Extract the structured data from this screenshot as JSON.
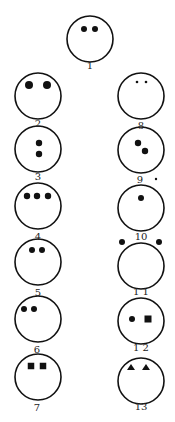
{
  "diagram": {
    "type": "figure-set",
    "stroke_color": "#111111",
    "fill_color": "#111111",
    "figures": [
      {
        "label": "1",
        "cx": 90,
        "cy": 39,
        "marks": [
          {
            "shape": "dot",
            "x": 84,
            "y": 29,
            "r": 3
          },
          {
            "shape": "dot",
            "x": 95,
            "y": 29,
            "r": 3
          }
        ]
      },
      {
        "label": "2",
        "cx": 38,
        "cy": 96,
        "marks": [
          {
            "shape": "dot",
            "x": 29,
            "y": 85,
            "r": 4
          },
          {
            "shape": "dot",
            "x": 47,
            "y": 85,
            "r": 4
          }
        ]
      },
      {
        "label": "3",
        "cx": 38,
        "cy": 149,
        "marks": [
          {
            "shape": "dot",
            "x": 39,
            "y": 143,
            "r": 3.2
          },
          {
            "shape": "dot",
            "x": 39,
            "y": 154,
            "r": 3.2
          }
        ]
      },
      {
        "label": "4",
        "cx": 38,
        "cy": 206,
        "marks": [
          {
            "shape": "dot",
            "x": 27,
            "y": 196,
            "r": 3.2
          },
          {
            "shape": "dot",
            "x": 37,
            "y": 196,
            "r": 3.2
          },
          {
            "shape": "dot",
            "x": 48,
            "y": 196,
            "r": 3.2
          }
        ]
      },
      {
        "label": "5",
        "cx": 38,
        "cy": 262,
        "marks": [
          {
            "shape": "dot",
            "x": 32,
            "y": 250,
            "r": 3
          },
          {
            "shape": "dot",
            "x": 42,
            "y": 250,
            "r": 3
          }
        ]
      },
      {
        "label": "6",
        "cx": 38,
        "cy": 319,
        "marks": [
          {
            "shape": "dot",
            "x": 24,
            "y": 309,
            "r": 3
          },
          {
            "shape": "dot",
            "x": 34,
            "y": 309,
            "r": 3
          }
        ]
      },
      {
        "label": "7",
        "cx": 38,
        "cy": 377,
        "marks": [
          {
            "shape": "square",
            "x": 31,
            "y": 366,
            "s": 6.5
          },
          {
            "shape": "square",
            "x": 43,
            "y": 366,
            "s": 6.5
          }
        ]
      },
      {
        "label": "8",
        "cx": 141,
        "cy": 96,
        "marks": [
          {
            "shape": "dot",
            "x": 137,
            "y": 82,
            "r": 1.3
          },
          {
            "shape": "dot",
            "x": 146,
            "y": 82,
            "r": 1.3
          }
        ]
      },
      {
        "label": "9",
        "cx": 141,
        "cy": 150,
        "marks": [
          {
            "shape": "dot",
            "x": 138,
            "y": 143,
            "r": 3.2
          },
          {
            "shape": "dot",
            "x": 145,
            "y": 151,
            "r": 3.2
          }
        ]
      },
      {
        "label": "10",
        "cx": 141,
        "cy": 208,
        "marks": [
          {
            "shape": "dot",
            "x": 141,
            "y": 198,
            "r": 3
          }
        ]
      },
      {
        "label": "11",
        "cx": 141,
        "cy": 266,
        "marks": [
          {
            "shape": "dot",
            "x": 122,
            "y": 242,
            "r": 3
          },
          {
            "shape": "dot",
            "x": 159,
            "y": 242,
            "r": 3
          }
        ]
      },
      {
        "label": "12",
        "cx": 141,
        "cy": 321,
        "marks": [
          {
            "shape": "dot",
            "x": 132,
            "y": 319,
            "r": 3
          },
          {
            "shape": "square",
            "x": 148,
            "y": 319,
            "s": 7
          }
        ]
      },
      {
        "label": "13",
        "cx": 141,
        "cy": 381,
        "marks": [
          {
            "shape": "triangle",
            "x": 131,
            "y": 367,
            "s": 8
          },
          {
            "shape": "triangle",
            "x": 146,
            "y": 367,
            "s": 8
          }
        ]
      }
    ],
    "labels": [
      {
        "text": "1",
        "x": 90,
        "y": 69
      },
      {
        "text": "2",
        "x": 38,
        "y": 127
      },
      {
        "text": "3",
        "x": 38,
        "y": 180
      },
      {
        "text": "4",
        "x": 38,
        "y": 240
      },
      {
        "text": "5",
        "x": 38,
        "y": 296
      },
      {
        "text": "6",
        "x": 37,
        "y": 353
      },
      {
        "text": "7",
        "x": 37,
        "y": 411
      },
      {
        "text": "8",
        "x": 141,
        "y": 129
      },
      {
        "text": "9",
        "x": 140,
        "y": 183
      },
      {
        "text": "10",
        "x": 141,
        "y": 240
      },
      {
        "text": "1 1",
        "x": 141,
        "y": 295
      },
      {
        "text": "1 2",
        "x": 141,
        "y": 351
      },
      {
        "text": "13",
        "x": 141,
        "y": 410
      }
    ],
    "extra_marks": [
      {
        "shape": "dot",
        "x": 156,
        "y": 179,
        "r": 1.2,
        "note": "small stray dot beside label 9"
      }
    ],
    "circle_radius": 23
  }
}
